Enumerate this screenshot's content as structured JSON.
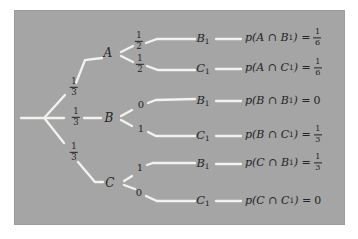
{
  "figure": {
    "type": "probability-tree-diagram",
    "colors": {
      "page_bg": "#ffffff",
      "panel_bg": "#a5a5a5",
      "branch_line": "#f3f2ef",
      "text": "#242424"
    }
  },
  "tree": {
    "root_branches": [
      {
        "target": "A",
        "prob_num": "1",
        "prob_den": "3"
      },
      {
        "target": "B",
        "prob_num": "1",
        "prob_den": "3"
      },
      {
        "target": "C",
        "prob_num": "1",
        "prob_den": "3"
      }
    ],
    "nodes": [
      {
        "label": "A"
      },
      {
        "label": "B"
      },
      {
        "label": "C"
      }
    ],
    "fork_A": [
      {
        "prob_num": "1",
        "prob_den": "2"
      },
      {
        "prob_num": "1",
        "prob_den": "2"
      }
    ],
    "fork_B": [
      {
        "prob": "0"
      },
      {
        "prob": "1"
      }
    ],
    "fork_C": [
      {
        "prob": "1"
      },
      {
        "prob": "0"
      }
    ]
  },
  "rows": [
    {
      "leaf": "B",
      "leaf_sub": "1",
      "expr_pre": "p(A ∩ B",
      "expr_sub": "1",
      "expr_post": ") =",
      "value_num": "1",
      "value_den": "6"
    },
    {
      "leaf": "C",
      "leaf_sub": "1",
      "expr_pre": "p(A ∩ C",
      "expr_sub": "1",
      "expr_post": ") =",
      "value_num": "1",
      "value_den": "6"
    },
    {
      "leaf": "B",
      "leaf_sub": "1",
      "expr_pre": "p(B ∩ B",
      "expr_sub": "1",
      "expr_post": ") =",
      "value": "0"
    },
    {
      "leaf": "C",
      "leaf_sub": "1",
      "expr_pre": "p(B ∩ C",
      "expr_sub": "1",
      "expr_post": ") =",
      "value_num": "1",
      "value_den": "3"
    },
    {
      "leaf": "B",
      "leaf_sub": "1",
      "expr_pre": "p(C ∩ B",
      "expr_sub": "1",
      "expr_post": ") =",
      "value_num": "1",
      "value_den": "3"
    },
    {
      "leaf": "C",
      "leaf_sub": "1",
      "expr_pre": "p(C ∩ C",
      "expr_sub": "1",
      "expr_post": ") =",
      "value": "0"
    }
  ]
}
